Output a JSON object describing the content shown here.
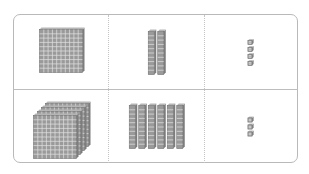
{
  "diagram": {
    "type": "base-ten-blocks place-value table",
    "columns": [
      "hundreds",
      "tens",
      "ones"
    ],
    "rows": [
      {
        "hundreds": 1,
        "tens": 2,
        "ones": 4
      },
      {
        "hundreds": 4,
        "tens": 6,
        "ones": 3
      }
    ]
  },
  "colors": {
    "border": "#b9b9b9",
    "divider": "#bdbdbd",
    "block_fill": "#9a9a9a",
    "block_grid": "#e2e2e2",
    "block_edge": "#6e6e6e"
  }
}
